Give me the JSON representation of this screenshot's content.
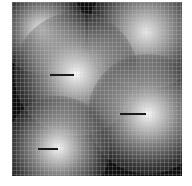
{
  "image": {
    "description": "Grayscale field with five bright gaussian blobs over a dark background, overlaid with a fine grid; three blobs contain a dark horizontal line marker",
    "background_color": "#0e0e0e",
    "grid_spacing_px": 4,
    "blobs": [
      {
        "cx": 30,
        "cy": 28,
        "r": 44,
        "peak": "#f2f2f2"
      },
      {
        "cx": 134,
        "cy": 30,
        "r": 58,
        "peak": "#e8e8e8"
      },
      {
        "cx": 64,
        "cy": 72,
        "r": 62,
        "peak": "#f7f7f7"
      },
      {
        "cx": 136,
        "cy": 112,
        "r": 60,
        "peak": "#f7f7f7"
      },
      {
        "cx": 46,
        "cy": 146,
        "r": 52,
        "peak": "#f5f5f5"
      }
    ],
    "markers": [
      {
        "x": 38,
        "y": 72,
        "w": 24
      },
      {
        "x": 108,
        "y": 111,
        "w": 26
      },
      {
        "x": 26,
        "y": 146,
        "w": 20
      }
    ]
  }
}
